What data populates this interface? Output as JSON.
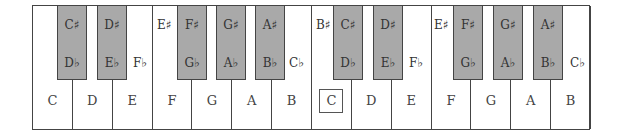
{
  "colors": {
    "white_key": "#ffffff",
    "black_key": "#a9a9a9",
    "outline": "#444444"
  },
  "white_keys": [
    {
      "label": "C"
    },
    {
      "label": "D"
    },
    {
      "label": "E"
    },
    {
      "label": "F"
    },
    {
      "label": "G"
    },
    {
      "label": "A"
    },
    {
      "label": "B"
    },
    {
      "label": "C",
      "boxed": true,
      "note": "middle C highlighted"
    },
    {
      "label": "D"
    },
    {
      "label": "E"
    },
    {
      "label": "F"
    },
    {
      "label": "G"
    },
    {
      "label": "A"
    },
    {
      "label": "B"
    }
  ],
  "black_keys": [
    {
      "sharp": "C♯",
      "flat": "D♭"
    },
    {
      "sharp": "D♯",
      "flat": "E♭"
    },
    {
      "sharp": "F♯",
      "flat": "G♭"
    },
    {
      "sharp": "G♯",
      "flat": "A♭"
    },
    {
      "sharp": "A♯",
      "flat": "B♭"
    },
    {
      "sharp": "C♯",
      "flat": "D♭"
    },
    {
      "sharp": "D♯",
      "flat": "E♭"
    },
    {
      "sharp": "F♯",
      "flat": "G♭"
    },
    {
      "sharp": "G♯",
      "flat": "A♭"
    },
    {
      "sharp": "A♯",
      "flat": "B♭"
    }
  ],
  "enharmonic_white_labels": [
    {
      "text": "E♯",
      "position": "top of F (octave 1)"
    },
    {
      "text": "F♭",
      "position": "middle of E (octave 1)"
    },
    {
      "text": "C♭",
      "position": "middle of B (octave 1)"
    },
    {
      "text": "B♯",
      "position": "top of C (octave 2)"
    },
    {
      "text": "F♭",
      "position": "middle of E (octave 2)"
    },
    {
      "text": "E♯",
      "position": "top of F (octave 2)"
    },
    {
      "text": "C♭",
      "position": "middle of B (octave 2)"
    }
  ]
}
